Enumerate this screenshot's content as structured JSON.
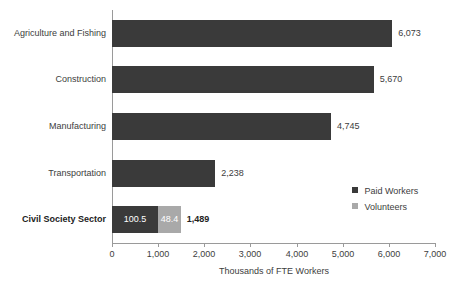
{
  "chart_data": {
    "type": "bar",
    "orientation": "horizontal",
    "stacked": true,
    "title": "",
    "xlabel": "Thousands of FTE Workers",
    "ylabel": "",
    "xlim": [
      0,
      7000
    ],
    "xticks": [
      "0",
      "1,000",
      "2,000",
      "3,000",
      "4,000",
      "5,000",
      "6,000",
      "7,000"
    ],
    "xtick_values": [
      0,
      1000,
      2000,
      3000,
      4000,
      5000,
      6000,
      7000
    ],
    "grid": false,
    "legend_position": "middle-right",
    "categories": [
      "Agriculture and Fishing",
      "Construction",
      "Manufacturing",
      "Transportation",
      "Civil Society Sector"
    ],
    "series": [
      {
        "name": "Paid Workers",
        "color": "#3a3a3a",
        "values": [
          6073,
          5670,
          4745,
          2238,
          1000.5
        ]
      },
      {
        "name": "Volunteers",
        "color": "#a9a9a9",
        "values": [
          0,
          0,
          0,
          0,
          488.4
        ]
      }
    ],
    "bars": [
      {
        "category": "Agriculture and Fishing",
        "bold": false,
        "paid": 6073,
        "volunteers": 0,
        "total": 6073,
        "total_label": "6,073",
        "paid_label": "",
        "volunteers_label": ""
      },
      {
        "category": "Construction",
        "bold": false,
        "paid": 5670,
        "volunteers": 0,
        "total": 5670,
        "total_label": "5,670",
        "paid_label": "",
        "volunteers_label": ""
      },
      {
        "category": "Manufacturing",
        "bold": false,
        "paid": 4745,
        "volunteers": 0,
        "total": 4745,
        "total_label": "4,745",
        "paid_label": "",
        "volunteers_label": ""
      },
      {
        "category": "Transportation",
        "bold": false,
        "paid": 2238,
        "volunteers": 0,
        "total": 2238,
        "total_label": "2,238",
        "paid_label": "",
        "volunteers_label": ""
      },
      {
        "category": "Civil Society Sector",
        "bold": true,
        "paid": 1000.5,
        "volunteers": 488.4,
        "total": 1489,
        "total_label": "1,489",
        "paid_label": "100.5",
        "volunteers_label": "48.4"
      }
    ],
    "legend": [
      {
        "label": "Paid Workers",
        "color": "#3a3a3a"
      },
      {
        "label": "Volunteers",
        "color": "#a9a9a9"
      }
    ]
  }
}
